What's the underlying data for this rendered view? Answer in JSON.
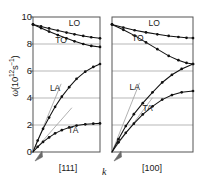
{
  "chart_data": {
    "type": "line",
    "title": "",
    "xlabel": "k",
    "ylabel": "ω(10¹²s⁻¹)",
    "ylim": [
      0,
      10
    ],
    "yticks": [
      0,
      2,
      4,
      6,
      8,
      10
    ],
    "grid": true,
    "legend_position": "inline-annotations",
    "panels": [
      {
        "id": "panel-111",
        "caption": "[111]",
        "xlim": [
          0,
          1
        ],
        "series": [
          {
            "name": "LO",
            "label": "LO",
            "label_x": 0.62,
            "label_y": 9.35,
            "marker": "filled-circle",
            "x": [
              0.0,
              0.12,
              0.24,
              0.37,
              0.5,
              0.62,
              0.75,
              0.87,
              1.0
            ],
            "values": [
              9.45,
              9.3,
              9.15,
              9.0,
              8.85,
              8.72,
              8.6,
              8.5,
              8.42
            ]
          },
          {
            "name": "TO",
            "label": "TO",
            "label_x": 0.42,
            "label_y": 8.05,
            "marker": "filled-circle",
            "x": [
              0.0,
              0.12,
              0.24,
              0.37,
              0.5,
              0.62,
              0.75,
              0.87,
              1.0
            ],
            "values": [
              9.45,
              9.18,
              8.92,
              8.66,
              8.42,
              8.2,
              8.0,
              7.86,
              7.78
            ]
          },
          {
            "name": "LA",
            "label": "LA",
            "label_x": 0.33,
            "label_y": 4.55,
            "marker": "filled-circle",
            "x": [
              0.0,
              0.07,
              0.15,
              0.24,
              0.33,
              0.43,
              0.54,
              0.65,
              0.78,
              0.9,
              1.0
            ],
            "values": [
              0.0,
              0.85,
              1.72,
              2.55,
              3.35,
              4.1,
              4.8,
              5.42,
              5.95,
              6.3,
              6.52
            ]
          },
          {
            "name": "TA",
            "label": "TA",
            "label_x": 0.6,
            "label_y": 1.42,
            "marker": "filled-circle",
            "x": [
              0.0,
              0.07,
              0.15,
              0.24,
              0.33,
              0.43,
              0.54,
              0.65,
              0.78,
              0.9,
              1.0
            ],
            "values": [
              0.0,
              0.38,
              0.75,
              1.08,
              1.38,
              1.62,
              1.82,
              1.96,
              2.05,
              2.1,
              2.12
            ]
          }
        ],
        "asymptotes": [
          {
            "name": "LA-sound-velocity",
            "x2": 0.42,
            "y2": 5.05
          },
          {
            "name": "TA-sound-velocity",
            "x2": 0.58,
            "y2": 3.28
          }
        ]
      },
      {
        "id": "panel-100",
        "caption": "[100]",
        "xlim": [
          0,
          1
        ],
        "series": [
          {
            "name": "LO",
            "label": "LO",
            "label_x": 0.52,
            "label_y": 9.35,
            "marker": "filled-circle",
            "x": [
              0.0,
              0.14,
              0.28,
              0.42,
              0.56,
              0.7,
              0.82,
              0.92,
              1.0
            ],
            "values": [
              9.45,
              9.22,
              9.02,
              8.86,
              8.72,
              8.6,
              8.52,
              8.46,
              8.44
            ]
          },
          {
            "name": "TO",
            "label": "TO",
            "label_x": 0.32,
            "label_y": 8.22,
            "marker": "filled-circle",
            "x": [
              0.0,
              0.14,
              0.28,
              0.42,
              0.56,
              0.7,
              0.82,
              0.92,
              1.0
            ],
            "values": [
              9.45,
              9.05,
              8.62,
              8.12,
              7.62,
              7.12,
              6.8,
              6.6,
              6.52
            ]
          },
          {
            "name": "LA",
            "label": "LA",
            "label_x": 0.28,
            "label_y": 4.62,
            "marker": "filled-circle",
            "x": [
              0.0,
              0.08,
              0.17,
              0.27,
              0.38,
              0.5,
              0.62,
              0.74,
              0.86,
              1.0
            ],
            "values": [
              0.0,
              0.95,
              1.92,
              2.8,
              3.62,
              4.42,
              5.15,
              5.72,
              6.15,
              6.52
            ]
          },
          {
            "name": "TA",
            "label": "TA",
            "label_x": 0.44,
            "label_y": 3.02,
            "marker": "filled-circle",
            "x": [
              0.0,
              0.08,
              0.17,
              0.27,
              0.38,
              0.5,
              0.62,
              0.74,
              0.86,
              1.0
            ],
            "values": [
              0.0,
              0.72,
              1.42,
              2.1,
              2.78,
              3.38,
              3.88,
              4.22,
              4.42,
              4.52
            ]
          }
        ],
        "asymptotes": [
          {
            "name": "LA-sound-velocity",
            "x2": 0.34,
            "y2": 5.12
          },
          {
            "name": "TA-sound-velocity",
            "x2": 0.5,
            "y2": 4.02
          }
        ]
      }
    ]
  },
  "axis": {
    "ylabel_omega": "ω",
    "ylabel_rest_pre": "(10",
    "ylabel_exp1": "12",
    "ylabel_mid": "s",
    "ylabel_exp2": "−1",
    "ylabel_rest_post": ")",
    "yticks": [
      "10",
      "8",
      "6",
      "4",
      "2",
      "0"
    ],
    "xlabel": "k"
  },
  "captions": {
    "left_panel": "[111]",
    "right_panel": "[100]"
  },
  "colors": {
    "curve": "#111111",
    "marker": "#111111",
    "grid": "#9a9a9a",
    "frame": "#555555",
    "asymptote": "#a8a8a8",
    "background": "#ffffff",
    "text": "#1a1a1a"
  }
}
